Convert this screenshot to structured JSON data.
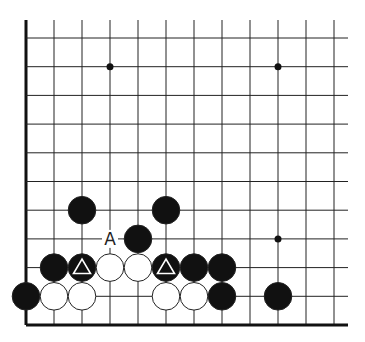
{
  "diagram": {
    "title": "",
    "type": "go-board-fragment",
    "corner": "bottom-left",
    "grid": {
      "columns_visible": 12,
      "rows_visible": 11,
      "origin_x": 26,
      "origin_y": 325,
      "spacing_x": 28,
      "spacing_y": 28.7,
      "top_y": 20,
      "right_x": 348,
      "line_color": "#222222",
      "edge_color": "#111111"
    },
    "star_points": [
      {
        "col": 3,
        "row": 9
      },
      {
        "col": 9,
        "row": 9
      },
      {
        "col": 9,
        "row": 3
      }
    ],
    "stones": [
      {
        "color": "black",
        "col": 0,
        "row": 1
      },
      {
        "color": "white",
        "col": 1,
        "row": 1
      },
      {
        "color": "white",
        "col": 2,
        "row": 1
      },
      {
        "color": "white",
        "col": 5,
        "row": 1
      },
      {
        "color": "white",
        "col": 6,
        "row": 1
      },
      {
        "color": "black",
        "col": 7,
        "row": 1
      },
      {
        "color": "black",
        "col": 9,
        "row": 1
      },
      {
        "color": "black",
        "col": 1,
        "row": 2
      },
      {
        "color": "black",
        "col": 2,
        "row": 2,
        "mark": "triangle"
      },
      {
        "color": "white",
        "col": 3,
        "row": 2
      },
      {
        "color": "white",
        "col": 4,
        "row": 2
      },
      {
        "color": "black",
        "col": 5,
        "row": 2,
        "mark": "triangle"
      },
      {
        "color": "black",
        "col": 6,
        "row": 2
      },
      {
        "color": "black",
        "col": 7,
        "row": 2
      },
      {
        "color": "black",
        "col": 4,
        "row": 3
      },
      {
        "color": "black",
        "col": 2,
        "row": 4
      },
      {
        "color": "black",
        "col": 5,
        "row": 4
      }
    ],
    "labels": [
      {
        "text": "A",
        "col": 3,
        "row": 3
      }
    ],
    "colors": {
      "black_stone": "#111111",
      "white_stone": "#ffffff",
      "stone_outline": "#222222",
      "triangle_mark": "#ffffff",
      "label": "#222222"
    }
  }
}
